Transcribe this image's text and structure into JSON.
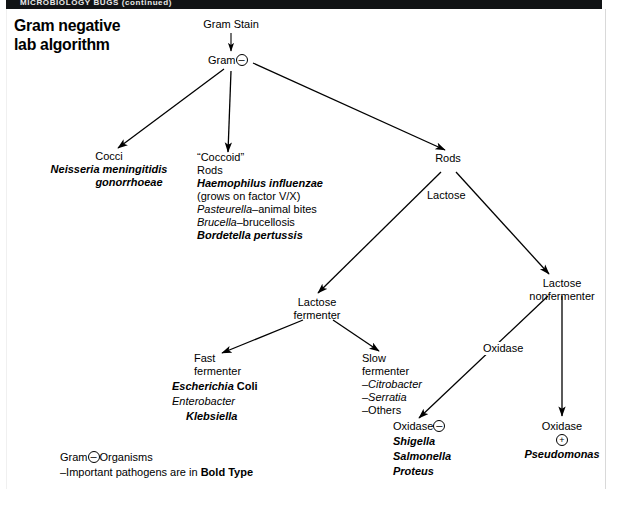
{
  "banner": {
    "text": "MICROBIOLOGY    BUGS (continued)"
  },
  "title": {
    "line1": "Gram negative",
    "line2": "lab algorithm"
  },
  "symbols": {
    "minus": "–",
    "plus": "+"
  },
  "nodes": {
    "gram_stain": {
      "label": "Gram Stain"
    },
    "gram_neg": {
      "label": "Gram"
    },
    "cocci": {
      "heading": "Cocci",
      "items": [
        {
          "text": "Neisseria meningitidis",
          "style": "bi"
        },
        {
          "text": "gonorrhoeae",
          "style": "bi"
        }
      ]
    },
    "coccoid": {
      "heading_line1": "“Coccoid”",
      "heading_line2": "Rods",
      "items": [
        {
          "text": "Haemophilus influenzae",
          "style": "bi"
        },
        {
          "text": "(grows on factor  V/X)",
          "style": "plain"
        },
        {
          "text": "Pasteurella",
          "suffix": "–animal bites",
          "style": "i"
        },
        {
          "text": "Brucella",
          "suffix": "–brucellosis",
          "style": "i"
        },
        {
          "text": "Bordetella pertussis",
          "style": "bi"
        }
      ]
    },
    "rods": {
      "label": "Rods"
    },
    "lactose_fermenter": {
      "line1": "Lactose",
      "line2": "fermenter"
    },
    "lactose_nonfermenter": {
      "line1": "Lactose",
      "line2": "nonfermenter"
    },
    "fast_fermenter": {
      "line1": "Fast",
      "line2": "fermenter",
      "items": [
        {
          "text": "Escherichia ",
          "suffix": "Coli",
          "style": "bi-b"
        },
        {
          "text": "Enterobacter",
          "style": "i"
        },
        {
          "text": "Klebsiella",
          "style": "bi"
        }
      ]
    },
    "slow_fermenter": {
      "line1": "Slow",
      "line2": "fermenter",
      "items": [
        {
          "text": "–Citrobacter",
          "style": "i"
        },
        {
          "text": "–Serratia",
          "style": "i"
        },
        {
          "text": "–Others",
          "style": "plain"
        }
      ]
    },
    "oxidase_negative": {
      "label": "Oxidase",
      "items": [
        {
          "text": "Shigella",
          "style": "bi"
        },
        {
          "text": "Salmonella",
          "style": "bi"
        },
        {
          "text": "Proteus",
          "style": "bi"
        }
      ]
    },
    "oxidase_positive": {
      "label": "Oxidase",
      "items": [
        {
          "text": "Pseudomonas",
          "style": "bi"
        }
      ]
    }
  },
  "edge_labels": {
    "lactose": "Lactose",
    "oxidase": "Oxidase"
  },
  "legend": {
    "line1_prefix": "Gram",
    "line1_suffix": "Organisms",
    "line2_prefix": "–Important pathogens are in ",
    "line2_bold": "Bold Type"
  }
}
